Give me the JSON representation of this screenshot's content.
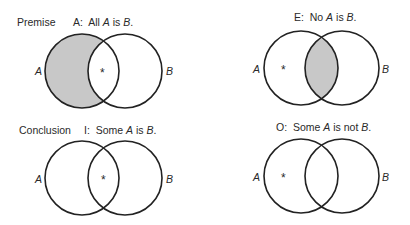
{
  "row_labels": {
    "premise": "Premise",
    "conclusion": "Conclusion"
  },
  "diagrams": [
    {
      "id": "A",
      "title_prefix": "A:",
      "title": "All A is B.",
      "shaded_region": "A only",
      "asterisk_region": "A and B",
      "set_left": "A",
      "set_right": "B"
    },
    {
      "id": "E",
      "title_prefix": "E:",
      "title": "No A is B.",
      "shaded_region": "A and B",
      "asterisk_region": "A only",
      "set_left": "A",
      "set_right": "B"
    },
    {
      "id": "I",
      "title_prefix": "I:",
      "title": "Some A is B.",
      "shaded_region": "none",
      "asterisk_region": "A and B",
      "set_left": "A",
      "set_right": "B"
    },
    {
      "id": "O",
      "title_prefix": "O:",
      "title": "Some A is not B.",
      "shaded_region": "none",
      "asterisk_region": "A only",
      "set_left": "A",
      "set_right": "B"
    }
  ],
  "marker": "*",
  "colors": {
    "stroke": "#222222",
    "shade": "#c8c8c8",
    "text": "#2a2a2a"
  }
}
